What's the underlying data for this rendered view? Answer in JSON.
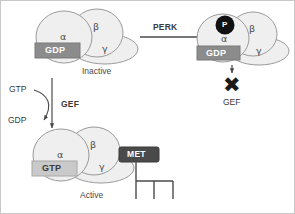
{
  "figure": {
    "colors": {
      "subunit_fill": "#efefef",
      "subunit_stroke": "#9a9a9a",
      "gdp_box_fill": "#8c8c8c",
      "gtp_box_fill": "#c9c9c9",
      "met_box_fill": "#4a4a4a",
      "phosphate_fill": "#111111",
      "arrow_stroke": "#4a4a4a",
      "x_color": "#1a1a1a"
    }
  },
  "inactive_complex": {
    "alpha_label": "α",
    "beta_label": "β",
    "gamma_label": "γ",
    "nucleotide": "GDP",
    "state": "Inactive"
  },
  "phosphorylated_complex": {
    "alpha_label": "α",
    "beta_label": "β",
    "gamma_label": "γ",
    "nucleotide": "GDP",
    "phosphate": "P"
  },
  "active_complex": {
    "alpha_label": "α",
    "beta_label": "β",
    "gamma_label": "γ",
    "nucleotide": "GTP",
    "effector": "MET",
    "state": "Active"
  },
  "perk_arrow": {
    "label": "PERK"
  },
  "gef_exchange": {
    "label": "GEF",
    "substrate_in": "GTP",
    "product_out": "GDP"
  },
  "blocked_gef": {
    "x_symbol": "✖",
    "label": "GEF"
  }
}
